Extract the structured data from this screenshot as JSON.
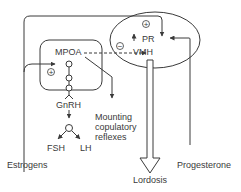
{
  "diagram": {
    "type": "neuroendocrine-pathway",
    "nodes": {
      "mpoa": "MPOA",
      "vmh": "VMH",
      "pr": "PR",
      "gnrh": "GnRH",
      "fsh": "FSH",
      "lh": "LH",
      "mounting": [
        "Mounting",
        "copulatory",
        "reflexes"
      ],
      "estrogens": "Estrogens",
      "progesterone": "Progesterone",
      "lordosis": "Lordosis"
    },
    "signs": {
      "plus": "+",
      "minus": "−"
    },
    "edges": [
      {
        "from": "Estrogens",
        "to": "MPOA",
        "sign": "+"
      },
      {
        "from": "Estrogens",
        "to": "PR",
        "sign": "+"
      },
      {
        "from": "Progesterone",
        "to": "PR"
      },
      {
        "from": "MPOA",
        "to": "VMH",
        "sign": "−",
        "style": "dashed"
      },
      {
        "from": "MPOA",
        "to": "Mounting copulatory reflexes"
      },
      {
        "from": "MPOA",
        "to": "GnRH"
      },
      {
        "from": "GnRH",
        "to": "FSH"
      },
      {
        "from": "GnRH",
        "to": "LH"
      },
      {
        "from": "PR",
        "to": "VMH"
      },
      {
        "from": "VMH",
        "to": "Lordosis"
      }
    ],
    "colors": {
      "line": "#3a3a3a",
      "background": "#ffffff"
    }
  }
}
